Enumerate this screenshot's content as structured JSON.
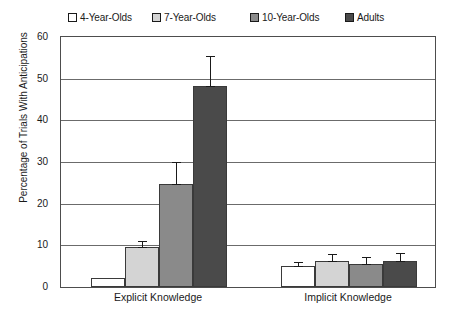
{
  "chart_data": {
    "type": "bar",
    "title": "",
    "xlabel": "",
    "ylabel": "Percentage of Trials With Anticipations",
    "ylim": [
      0,
      60
    ],
    "yticks": [
      0,
      10,
      20,
      30,
      40,
      50,
      60
    ],
    "grid": true,
    "legend_position": "top",
    "categories": [
      "Explicit Knowledge",
      "Implicit Knowledge"
    ],
    "series": [
      {
        "name": "4-Year-Olds",
        "color": "#ffffff",
        "values": [
          2.1,
          5.0
        ],
        "errors": [
          0.0,
          1.1
        ]
      },
      {
        "name": "7-Year-Olds",
        "color": "#d4d4d4",
        "values": [
          9.6,
          6.3
        ],
        "errors": [
          1.4,
          1.6
        ]
      },
      {
        "name": "10-Year-Olds",
        "color": "#8a8a8a",
        "values": [
          24.7,
          5.5
        ],
        "errors": [
          5.3,
          1.6
        ]
      },
      {
        "name": "Adults",
        "color": "#4a4a4a",
        "values": [
          48.2,
          6.2
        ],
        "errors": [
          7.2,
          1.9
        ]
      }
    ]
  },
  "legend": {
    "items": [
      {
        "label": "4-Year-Olds",
        "color": "#ffffff"
      },
      {
        "label": "7-Year-Olds",
        "color": "#d4d4d4"
      },
      {
        "label": "10-Year-Olds",
        "color": "#8a8a8a"
      },
      {
        "label": "Adults",
        "color": "#4a4a4a"
      }
    ]
  },
  "axes": {
    "y_title": "Percentage of Trials With Anticipations",
    "y_tick_labels": [
      "0",
      "10",
      "20",
      "30",
      "40",
      "50",
      "60"
    ],
    "x_tick_labels": [
      "Explicit Knowledge",
      "Implicit Knowledge"
    ]
  }
}
